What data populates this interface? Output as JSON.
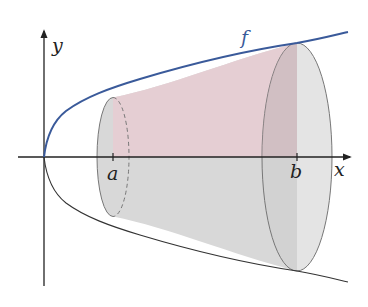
{
  "diagram": {
    "type": "solid-of-revolution",
    "labels": {
      "y_axis": "y",
      "x_axis": "x",
      "function": "f",
      "lower_bound": "a",
      "upper_bound": "b"
    },
    "colors": {
      "curve": "#3a5a9a",
      "mirror_curve": "#333333",
      "axes": "#222222",
      "cross_section_fill": "#e6cfd4",
      "solid_fill": "#d9d9d9",
      "end_cap_fill": "#cfcfcf"
    }
  }
}
